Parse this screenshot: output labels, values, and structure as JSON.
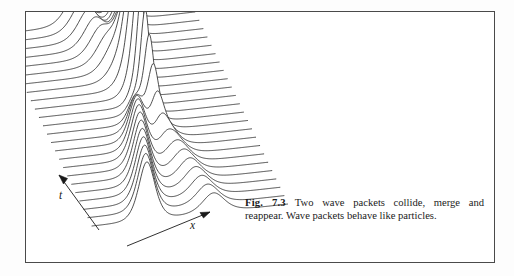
{
  "figure": {
    "frame": {
      "border_color": "#4a4a4a",
      "background": "#ffffff"
    },
    "axes": {
      "time_label": "t",
      "space_label": "x",
      "time_arrow_direction": "up-left",
      "space_arrow_direction": "up-right"
    },
    "caption": {
      "label": "Fig. 7.3",
      "text": "Two wave packets collide, merge and reappear. Wave packets behave like particles."
    }
  },
  "chart_data": {
    "type": "line",
    "title": "",
    "subtitle": "",
    "xlabel": "x",
    "ylabel": "",
    "zlabel": "t",
    "style": "waterfall",
    "grid": false,
    "legend": null,
    "n_traces": 24,
    "trace_direction": "front-to-back (time increases upward/backward)",
    "line_color": "#222222",
    "line_width": 0.8,
    "projection": {
      "x_span_px": 196,
      "row_dx_px": -4.05,
      "row_dy_px": -8.35,
      "front_baseline_y_px": 214,
      "front_baseline_x_px": 66,
      "baseline_slope_dy_px": -22
    },
    "packets": [
      {
        "name": "left packet",
        "x_start": 0.28,
        "x_end": 0.62,
        "amplitude_front": 58,
        "width": 0.055
      },
      {
        "name": "right packet",
        "x_start": 0.62,
        "x_end": 0.4,
        "amplitude_front": 26,
        "width": 0.075
      }
    ],
    "collision": {
      "merge_trace_index": 13,
      "merged_peak_amplitude": 105,
      "merged_peak_x": 0.52,
      "note": "peaks merge near the middle traces then reappear"
    },
    "axis_ranges": {
      "x": [
        0,
        1
      ],
      "t": [
        0,
        1
      ],
      "amplitude": [
        0,
        105
      ]
    }
  }
}
